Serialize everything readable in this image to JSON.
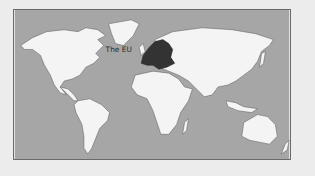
{
  "map": {
    "label": "The EU",
    "colors": {
      "background": "#ececec",
      "ocean": "#a6a6a6",
      "land": "#f4f4f4",
      "highlight": "#333333",
      "coast": "#555555"
    },
    "highlighted_region": "European Union",
    "regions": [
      "North America",
      "Greenland",
      "South America",
      "Europe",
      "Africa",
      "Asia",
      "Australia",
      "New Zealand",
      "Madagascar",
      "Japan",
      "Indonesia"
    ]
  }
}
